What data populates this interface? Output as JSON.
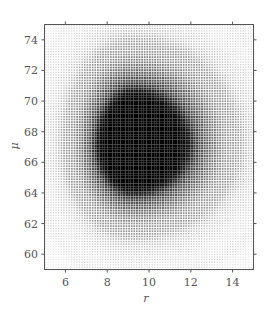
{
  "chart_data": {
    "type": "heatmap",
    "title": "",
    "xlabel": "r",
    "ylabel": "μ",
    "xlim": [
      5,
      15
    ],
    "ylim": [
      59,
      75
    ],
    "x_ticks": [
      6,
      8,
      10,
      12,
      14
    ],
    "y_ticks": [
      60,
      62,
      64,
      66,
      68,
      70,
      72,
      74
    ],
    "grid": false,
    "legend": null,
    "colormap": "grayscale (white = low density, black = high density)",
    "rendering": "dot-matrix shading",
    "peak": {
      "r": 9.2,
      "mu": 67.2
    },
    "spread": {
      "r_left": 1.9,
      "r_right": 2.9,
      "mu_down": 3.4,
      "mu_up": 3.9
    },
    "contour_rings": 4
  },
  "colors": {
    "background": "#ffffff",
    "frame": "#555555",
    "ink": "#111111"
  }
}
